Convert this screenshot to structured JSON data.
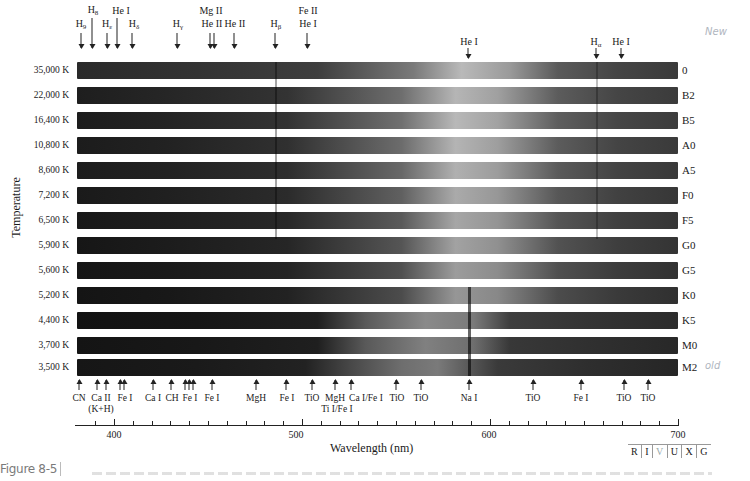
{
  "figure": {
    "caption_label": "Figure 8-5",
    "notes": {
      "top": "New",
      "bottom": "old"
    }
  },
  "chart_data": {
    "type": "heatmap",
    "xlabel": "Wavelength (nm)",
    "ylabel": "Temperature",
    "xlim": [
      383,
      700
    ],
    "x_ticks": [
      400,
      500,
      600,
      700
    ],
    "x_minor_tick_step": 10,
    "rows": [
      {
        "temperature": "35,000 K",
        "class": "0"
      },
      {
        "temperature": "22,000 K",
        "class": "B2"
      },
      {
        "temperature": "16,400 K",
        "class": "B5"
      },
      {
        "temperature": "10,800 K",
        "class": "A0"
      },
      {
        "temperature": "8,600 K",
        "class": "A5"
      },
      {
        "temperature": "7,200 K",
        "class": "F0"
      },
      {
        "temperature": "6,500 K",
        "class": "F5"
      },
      {
        "temperature": "5,900 K",
        "class": "G0"
      },
      {
        "temperature": "5,600 K",
        "class": "G5"
      },
      {
        "temperature": "5,200 K",
        "class": "K0"
      },
      {
        "temperature": "4,400 K",
        "class": "K5"
      },
      {
        "temperature": "3,700 K",
        "class": "M0"
      },
      {
        "temperature": "3,500 K",
        "class": "M2"
      }
    ],
    "top_lines": [
      {
        "label": "H9",
        "sym": "H",
        "sub": "9",
        "nm": 383
      },
      {
        "label": "H8",
        "sym": "H",
        "sub": "8",
        "nm": 389
      },
      {
        "label": "Hε",
        "sym": "H",
        "sub": "ε",
        "nm": 397
      },
      {
        "label": "He I",
        "sym": "He I",
        "sub": "",
        "nm": 402
      },
      {
        "label": "Hδ",
        "sym": "H",
        "sub": "δ",
        "nm": 410
      },
      {
        "label": "Hγ",
        "sym": "H",
        "sub": "γ",
        "nm": 434
      },
      {
        "label": "Mg II / He II",
        "line1": "Mg II",
        "line2": "He II",
        "nm": 453
      },
      {
        "label": "He II",
        "sym": "He II",
        "sub": "",
        "nm": 465
      },
      {
        "label": "Hβ",
        "sym": "H",
        "sub": "β",
        "nm": 486
      },
      {
        "label": "Fe II / He I",
        "line1": "Fe II",
        "line2": "He I",
        "nm": 504
      },
      {
        "label": "He I",
        "sym": "He I",
        "sub": "",
        "nm": 588
      },
      {
        "label": "Hα",
        "sym": "H",
        "sub": "α",
        "nm": 656
      },
      {
        "label": "He I",
        "sym": "He I",
        "sub": "",
        "nm": 668
      }
    ],
    "bottom_lines": [
      {
        "label": "CN",
        "nm": 388
      },
      {
        "label": "Ca II (K+H)",
        "line1": "Ca II",
        "line2": "(K+H)",
        "nm": 395
      },
      {
        "label": "Fe I",
        "nm": 406
      },
      {
        "label": "Ca I",
        "nm": 422
      },
      {
        "label": "CH",
        "nm": 431
      },
      {
        "label": "Fe I",
        "nm": 440
      },
      {
        "label": "Fe I",
        "nm": 452
      },
      {
        "label": "MgH",
        "nm": 478
      },
      {
        "label": "Fe I",
        "nm": 496
      },
      {
        "label": "TiO",
        "nm": 517
      },
      {
        "label": "MgH / Ti I/Fe I",
        "line1": "MgH",
        "line2": "Ti I/Fe I",
        "nm": 521
      },
      {
        "label": "Ca I/Fe I",
        "nm": 527
      },
      {
        "label": "TiO",
        "nm": 550
      },
      {
        "label": "TiO",
        "nm": 563
      },
      {
        "label": "Na I",
        "nm": 589
      },
      {
        "label": "TiO",
        "nm": 622
      },
      {
        "label": "Fe I",
        "nm": 646
      },
      {
        "label": "TiO",
        "nm": 668
      },
      {
        "label": "TiO",
        "nm": 678
      }
    ]
  },
  "top_labels": {
    "h9": "H",
    "h9_sub": "9",
    "h8": "H",
    "h8_sub": "8",
    "he": "H",
    "he_sub": "ε",
    "hei_1": "He  I",
    "hd": "H",
    "hd_sub": "δ",
    "hg": "H",
    "hg_sub": "γ",
    "mgii": "Mg II",
    "heii_1": "He II",
    "heii_2": "He II",
    "hb": "H",
    "hb_sub": "β",
    "feii": "Fe II",
    "hei_2": "He I",
    "hei_3": "He I",
    "ha": "H",
    "ha_sub": "α",
    "hei_4": "He I"
  },
  "bottom_labels": {
    "cn": "CN",
    "caii": "Ca II",
    "kh": "(K+H)",
    "fei_1": "Fe I",
    "cai": "Ca I",
    "ch": "CH",
    "fei_2": "Fe I",
    "fei_3": "Fe I",
    "mgh_1": "MgH",
    "fei_4": "Fe I",
    "tio_1": "TiO",
    "mgh_2": "MgH",
    "tife": "Ti I/Fe I",
    "cafe": "Ca I/Fe I",
    "tio_2": "TiO",
    "tio_3": "TiO",
    "nai": "Na I",
    "tio_4": "TiO",
    "fei_5": "Fe I",
    "tio_5": "TiO",
    "tio_6": "TiO"
  },
  "axis": {
    "ticks": [
      "400",
      "500",
      "600",
      "700"
    ],
    "xlabel": "Wavelength (nm)",
    "ylabel": "Temperature"
  },
  "band_legend": [
    "R",
    "I",
    "V",
    "U",
    "X",
    "G"
  ],
  "colors": {
    "band_dark": "#1e1e1e",
    "band_mid": "#3a3a3a",
    "band_light": "#c8c8c8",
    "text": "#1a1a1a"
  }
}
